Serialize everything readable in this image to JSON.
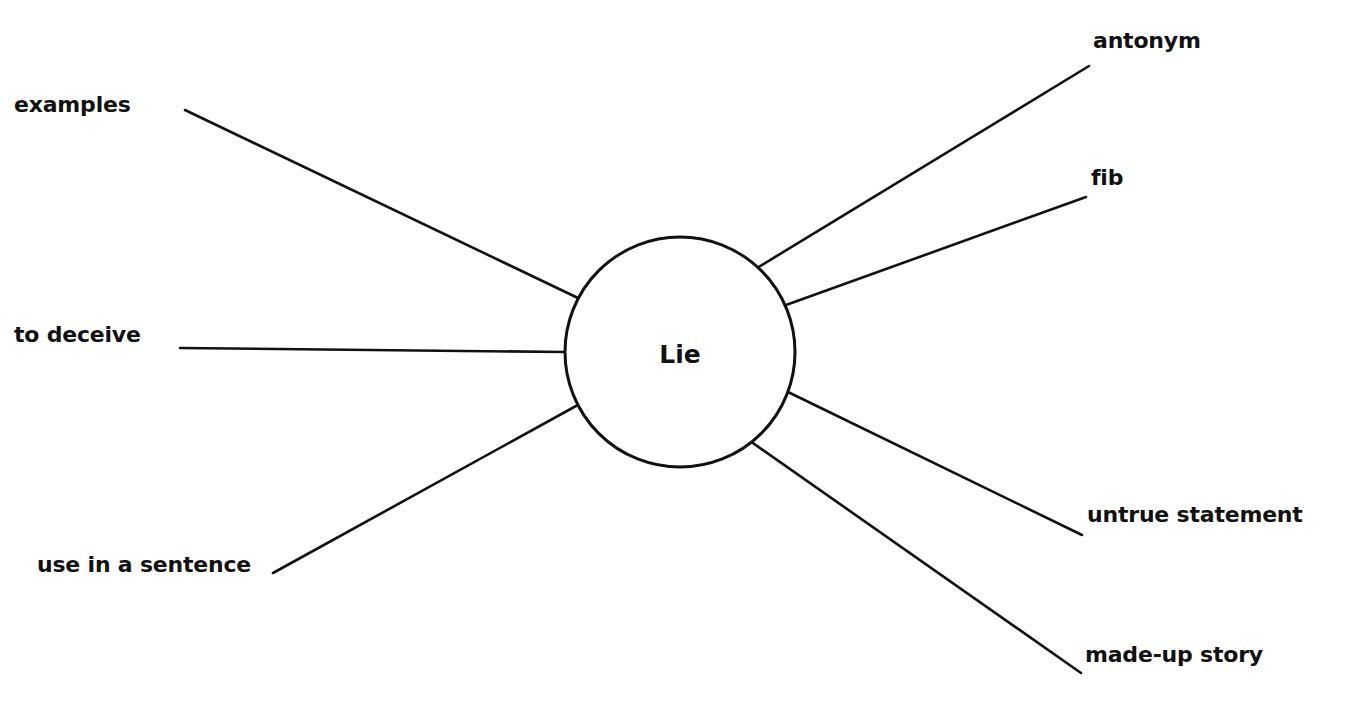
{
  "diagram": {
    "type": "word-web",
    "center": {
      "label": "Lie",
      "cx": 680,
      "cy": 352,
      "r": 115
    },
    "stroke_color": "#111111",
    "branches": [
      {
        "id": "examples",
        "label": "examples",
        "side": "left",
        "label_x": 14,
        "label_y": 94,
        "line": [
          185,
          110,
          578,
          298
        ]
      },
      {
        "id": "to-deceive",
        "label": "to deceive",
        "side": "left",
        "label_x": 14,
        "label_y": 324,
        "line": [
          180,
          348,
          565,
          352
        ]
      },
      {
        "id": "use-in-a-sentence",
        "label": "use in a sentence",
        "side": "left",
        "label_x": 37,
        "label_y": 554,
        "line": [
          273,
          573,
          576,
          406
        ]
      },
      {
        "id": "antonym",
        "label": "antonym",
        "side": "right",
        "label_x": 1093,
        "label_y": 30,
        "line": [
          757,
          268,
          1089,
          66
        ]
      },
      {
        "id": "fib",
        "label": "fib",
        "side": "right",
        "label_x": 1091,
        "label_y": 167,
        "line": [
          786,
          305,
          1086,
          197
        ]
      },
      {
        "id": "untrue-statement",
        "label": "untrue statement",
        "side": "right",
        "label_x": 1087,
        "label_y": 504,
        "line": [
          788,
          392,
          1082,
          535
        ]
      },
      {
        "id": "made-up-story",
        "label": "made-up story",
        "side": "right",
        "label_x": 1085,
        "label_y": 644,
        "line": [
          750,
          441,
          1081,
          673
        ]
      }
    ]
  }
}
